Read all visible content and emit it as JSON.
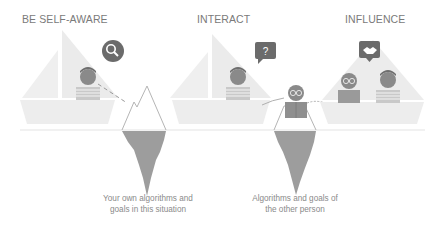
{
  "headings": {
    "self_aware": "BE SELF-AWARE",
    "interact": "INTERACT",
    "influence": "INFLUENCE"
  },
  "captions": {
    "own": {
      "line1": "Your own algorithms and",
      "line2": "goals in this situation"
    },
    "other": {
      "line1": "Algorithms and goals of",
      "line2": "the other person"
    }
  },
  "icons": {
    "self_aware": "magnifier-icon",
    "interact": "question-bubble-icon",
    "influence": "handshake-bubble-icon"
  },
  "colors": {
    "sail": "#ececec",
    "hull": "#ededed",
    "iceberg_under": "#9d9d9d",
    "iceberg_line": "#b8b8b8",
    "bubble": "#6b6b6b",
    "person_head": "#8a8a8a",
    "water_line": "#e3e3e3",
    "text": "#7a7a7a"
  }
}
